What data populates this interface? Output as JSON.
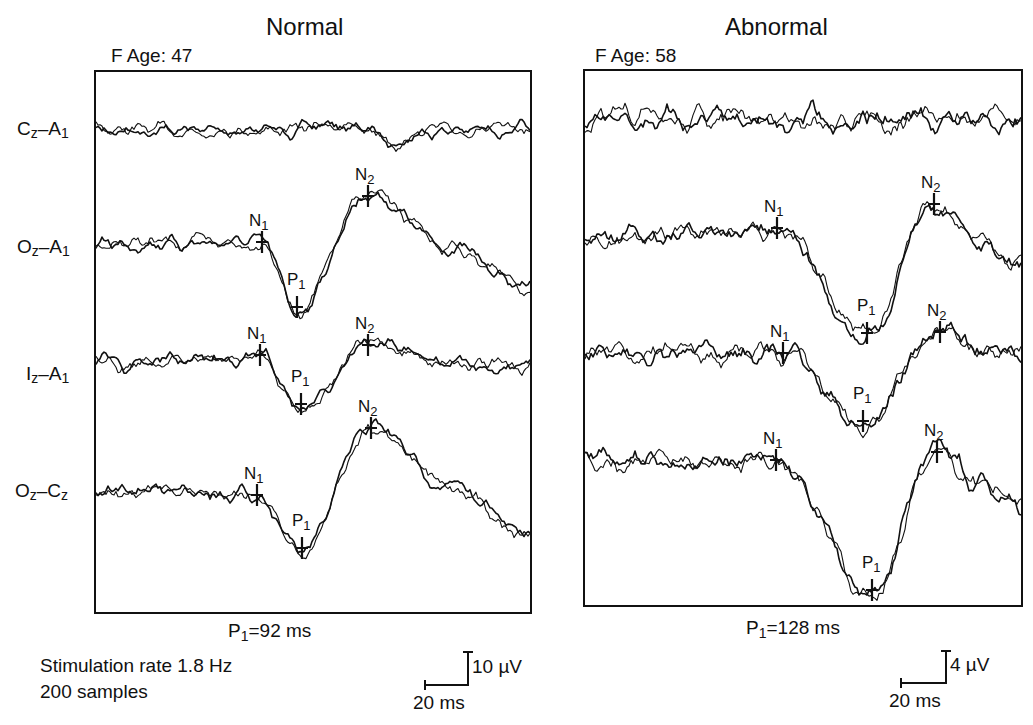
{
  "panels": [
    {
      "title": "Normal",
      "subject": "F  Age:  47",
      "p1_text_main": "P",
      "p1_text_sub": "1",
      "p1_text_rest": "=92 ms",
      "scale": {
        "voltage": "10 µV",
        "time": "20 ms"
      }
    },
    {
      "title": "Abnormal",
      "subject": "F  Age:  58",
      "p1_text_main": "P",
      "p1_text_sub": "1",
      "p1_text_rest": "=128 ms",
      "scale": {
        "voltage": "4 µV",
        "time": "20 ms"
      }
    }
  ],
  "channels": [
    {
      "main": "C",
      "sub1": "z",
      "mid": "–A",
      "sub2": "1"
    },
    {
      "main": "O",
      "sub1": "z",
      "mid": "–A",
      "sub2": "1"
    },
    {
      "main": "I",
      "sub1": "z",
      "mid": "–A",
      "sub2": "1"
    },
    {
      "main": "O",
      "sub1": "z",
      "mid": "–C",
      "sub2": "z"
    }
  ],
  "footer": {
    "stim_rate": "Stimulation rate  1.8 Hz",
    "samples": "200 samples"
  },
  "chart_data": [
    {
      "type": "line",
      "title": "Normal",
      "subtitle": "F Age: 47",
      "xlabel": "Time (scale bar 20 ms)",
      "ylabel": "Amplitude (scale bar 10 µV)",
      "grid": false,
      "annotation": "P1=92 ms",
      "stimulation_rate_hz": 1.8,
      "samples": 200,
      "series": [
        {
          "name": "Cz-A1",
          "baseline_y": 130,
          "markers": []
        },
        {
          "name": "Oz-A1",
          "baseline_y": 243,
          "markers": [
            {
              "label": "N1",
              "x": 262,
              "y": 242
            },
            {
              "label": "P1",
              "x": 297,
              "y": 307
            },
            {
              "label": "N2",
              "x": 368,
              "y": 196
            }
          ]
        },
        {
          "name": "Iz-A1",
          "baseline_y": 363,
          "markers": [
            {
              "label": "N1",
              "x": 260,
              "y": 355
            },
            {
              "label": "P1",
              "x": 301,
              "y": 404
            },
            {
              "label": "N2",
              "x": 368,
              "y": 345
            }
          ]
        },
        {
          "name": "Oz-Cz",
          "baseline_y": 490,
          "markers": [
            {
              "label": "N1",
              "x": 257,
              "y": 495
            },
            {
              "label": "P1",
              "x": 302,
              "y": 548
            },
            {
              "label": "N2",
              "x": 371,
              "y": 428
            }
          ]
        }
      ]
    },
    {
      "type": "line",
      "title": "Abnormal",
      "subtitle": "F Age: 58",
      "xlabel": "Time (scale bar 20 ms)",
      "ylabel": "Amplitude (scale bar 4 µV)",
      "grid": false,
      "annotation": "P1=128 ms",
      "series": [
        {
          "name": "Cz-A1",
          "baseline_y": 120,
          "markers": []
        },
        {
          "name": "Oz-A1",
          "baseline_y": 238,
          "markers": [
            {
              "label": "N1",
              "x": 777,
              "y": 228
            },
            {
              "label": "P1",
              "x": 867,
              "y": 333
            },
            {
              "label": "N2",
              "x": 934,
              "y": 204
            }
          ]
        },
        {
          "name": "Iz-A1",
          "baseline_y": 352,
          "markers": [
            {
              "label": "N1",
              "x": 783,
              "y": 353
            },
            {
              "label": "P1",
              "x": 863,
              "y": 421
            },
            {
              "label": "N2",
              "x": 940,
              "y": 332
            }
          ]
        },
        {
          "name": "Oz-Cz",
          "baseline_y": 462,
          "markers": [
            {
              "label": "N1",
              "x": 776,
              "y": 460
            },
            {
              "label": "P1",
              "x": 872,
              "y": 590
            },
            {
              "label": "N2",
              "x": 937,
              "y": 452
            }
          ]
        }
      ]
    }
  ]
}
